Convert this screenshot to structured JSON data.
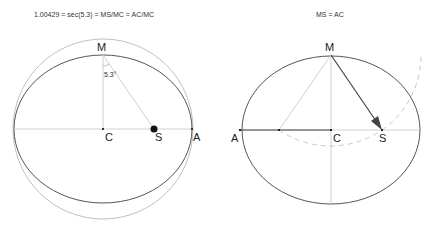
{
  "left": {
    "caption": "1.00429 = sec(5.3) = MS/MC = AC/MC",
    "labels": {
      "M": "M",
      "C": "C",
      "S": "S",
      "A": "A"
    },
    "angle": "5.3°"
  },
  "right": {
    "caption": "MS = AC",
    "labels": {
      "M": "M",
      "C": "C",
      "S": "S",
      "A": "A"
    }
  },
  "colors": {
    "ellipse": "#555555",
    "guide": "#bbbbbb",
    "circle": "#aaaaaa",
    "dashed": "#c8c8c8",
    "arrow": "#444444"
  }
}
